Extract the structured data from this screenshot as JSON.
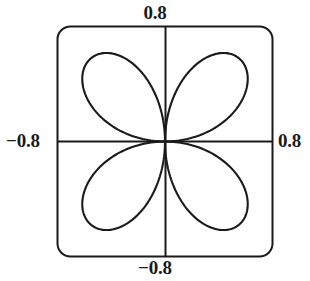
{
  "figure": {
    "background_color": "#ffffff",
    "stroke_color": "#1a1a1a",
    "label_color": "#1a1a1a"
  },
  "axis_labels": {
    "top": "0.8",
    "bottom": "−0.8",
    "left": "−0.8",
    "right": "0.8"
  },
  "chart_data": {
    "type": "line",
    "title": "",
    "subtitle": "",
    "xlabel": "",
    "ylabel": "",
    "xlim": [
      -0.8,
      0.8
    ],
    "ylim": [
      -0.8,
      0.8
    ],
    "xticks": [
      -0.8,
      0.8
    ],
    "ytick_labels": [
      "−0.8",
      "0.8"
    ],
    "xtick_labels": [
      "−0.8",
      "0.8"
    ],
    "yticks": [
      -0.8,
      0.8
    ],
    "grid": false,
    "legend": null,
    "legend_position": "none",
    "axes_style": "crosshair-through-origin",
    "frame": "rounded-rectangle",
    "curve": {
      "name": "four-petal rose",
      "polar_equation": "r = cos(2*theta)",
      "rotation_deg": 45,
      "petal_count": 4,
      "max_radius": 0.8,
      "petal_tip_angles_deg": [
        45,
        135,
        225,
        315
      ],
      "petal_tips_xy": [
        [
          0.566,
          0.566
        ],
        [
          -0.566,
          0.566
        ],
        [
          -0.566,
          -0.566
        ],
        [
          0.566,
          -0.566
        ]
      ],
      "origin_xy": [
        0,
        0
      ],
      "closed": true,
      "stroke_width": 2.1
    },
    "series": [
      {
        "name": "r = cos(2θ) rotated 45°",
        "theta_deg": [
          0,
          15,
          30,
          45,
          60,
          75,
          90,
          105,
          120,
          135,
          150,
          165,
          180,
          195,
          210,
          225,
          240,
          255,
          270,
          285,
          300,
          315,
          330,
          345,
          360
        ],
        "r": [
          0.0,
          0.4,
          0.693,
          0.8,
          0.693,
          0.4,
          0.0,
          0.4,
          0.693,
          0.8,
          0.693,
          0.4,
          0.0,
          0.4,
          0.693,
          0.8,
          0.693,
          0.4,
          0.0,
          0.4,
          0.693,
          0.8,
          0.693,
          0.4,
          0.0
        ]
      }
    ]
  }
}
